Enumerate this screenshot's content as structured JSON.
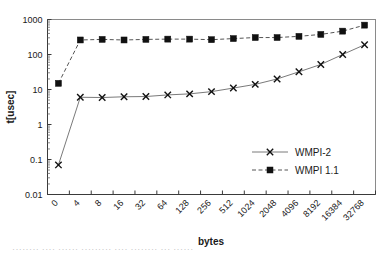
{
  "chart_data": {
    "type": "line",
    "title": "",
    "xlabel": "bytes",
    "ylabel": "t[usec]",
    "categories": [
      "0",
      "4",
      "8",
      "16",
      "32",
      "64",
      "128",
      "256",
      "512",
      "1024",
      "2048",
      "4096",
      "8192",
      "16384",
      "32768"
    ],
    "yscale": "log",
    "ylim": [
      0.01,
      1000
    ],
    "yticks": [
      "0.01",
      "0.1",
      "1",
      "10",
      "100",
      "1000"
    ],
    "grid": false,
    "legend_position": "inside-right-lower",
    "series": [
      {
        "name": "WMPI-2",
        "marker": "x",
        "linestyle": "solid",
        "color": "#111111",
        "values": [
          0.07,
          6.0,
          5.9,
          6.2,
          6.3,
          7.0,
          7.5,
          8.7,
          11.0,
          14.0,
          20.0,
          32.0,
          52.0,
          100.0,
          190.0
        ]
      },
      {
        "name": "WMPI 1.1",
        "marker": "square",
        "linestyle": "dashed",
        "color": "#111111",
        "values": [
          15.0,
          260.0,
          270.0,
          260.0,
          270.0,
          275.0,
          275.0,
          265.0,
          285.0,
          305.0,
          305.0,
          330.0,
          375.0,
          465.0,
          690.0
        ]
      }
    ]
  },
  "axes": {
    "y_title": "t[usec]",
    "x_title": "bytes"
  },
  "legend": {
    "entries": [
      {
        "label": "WMPI-2",
        "marker": "x",
        "linestyle": "solid"
      },
      {
        "label": "WMPI 1.1",
        "marker": "square",
        "linestyle": "dashed"
      }
    ]
  },
  "caption": {
    "text": "········ ···· ······ ········· ···· ········ ··· ······"
  }
}
